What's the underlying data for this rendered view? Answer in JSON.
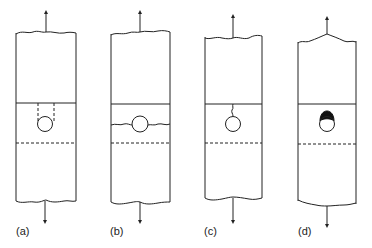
{
  "figure": {
    "type": "specimen schematic",
    "stroke_color": "#222222",
    "panels": [
      {
        "id": "a",
        "label": "(a)",
        "feature": "hole with dashed vertical lines extending from hole to top solid line"
      },
      {
        "id": "b",
        "label": "(b)",
        "feature": "hole with wavy horizontal crack extending across both sides"
      },
      {
        "id": "c",
        "label": "(c)",
        "feature": "hole with short wavy crack from top of hole to solid line"
      },
      {
        "id": "d",
        "label": "(d)",
        "feature": "hole with dark filled cap on top"
      }
    ]
  }
}
